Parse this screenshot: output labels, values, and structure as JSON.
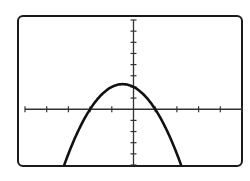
{
  "chart_data": {
    "type": "line",
    "title": "",
    "xlabel": "",
    "ylabel": "",
    "xlim": [
      -5,
      5
    ],
    "ylim": [
      -5,
      8
    ],
    "xscale_ticks": 1,
    "yscale_ticks": 1,
    "grid": false,
    "legend": "none",
    "series": [
      {
        "name": "y = -x^2 - x + 2",
        "equation": {
          "a": -1,
          "b": -1,
          "c": 2
        },
        "vertex": [
          -0.5,
          2.25
        ],
        "roots": [
          -2,
          1
        ],
        "x_range": [
          -3.19,
          2.19
        ]
      }
    ],
    "colors": {
      "frame": "#1a1a1a",
      "axis": "#333333",
      "curve": "#111111",
      "background": "#ffffff"
    }
  }
}
